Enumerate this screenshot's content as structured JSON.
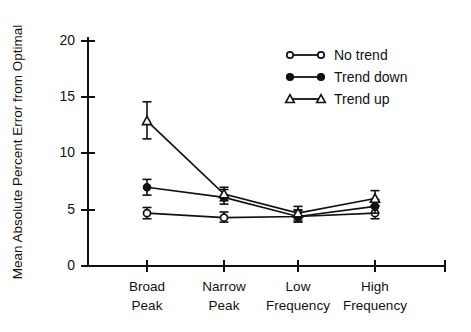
{
  "chart_data": {
    "type": "line",
    "title": "",
    "xlabel": "",
    "ylabel": "Mean Absolute Percent Error from Optimal",
    "categories": [
      "Broad\nPeak",
      "Narrow\nPeak",
      "Low\nFrequency",
      "High\nFrequency"
    ],
    "category_labels": [
      {
        "line1": "Broad",
        "line2": "Peak"
      },
      {
        "line1": "Narrow",
        "line2": "Peak"
      },
      {
        "line1": "Low",
        "line2": "Frequency"
      },
      {
        "line1": "High",
        "line2": "Frequency"
      }
    ],
    "ylim": [
      0,
      20
    ],
    "yticks": [
      0,
      5,
      10,
      15,
      20
    ],
    "ytick_labels": [
      "0",
      "5",
      "10",
      "15",
      "20"
    ],
    "grid": false,
    "legend_position": "upper right",
    "errorbars": true,
    "series": [
      {
        "name": "No trend",
        "marker": "open-circle",
        "values": [
          4.7,
          4.3,
          4.4,
          4.7
        ],
        "err_low": [
          4.2,
          3.9,
          4.0,
          4.2
        ],
        "err_high": [
          5.2,
          4.8,
          4.9,
          5.3
        ]
      },
      {
        "name": "Trend down",
        "marker": "filled-circle",
        "values": [
          7.0,
          6.1,
          4.4,
          5.3
        ],
        "err_low": [
          6.3,
          5.5,
          3.9,
          4.7
        ],
        "err_high": [
          7.7,
          6.8,
          5.0,
          5.9
        ]
      },
      {
        "name": "Trend up",
        "marker": "open-triangle",
        "values": [
          12.9,
          6.4,
          4.7,
          6.0
        ],
        "err_low": [
          11.3,
          5.8,
          4.2,
          5.4
        ],
        "err_high": [
          14.6,
          7.0,
          5.3,
          6.7
        ]
      }
    ]
  },
  "legend": {
    "entries": [
      {
        "label": "No trend",
        "marker": "open-circle"
      },
      {
        "label": "Trend down",
        "marker": "filled-circle"
      },
      {
        "label": "Trend up",
        "marker": "open-triangle"
      }
    ]
  }
}
